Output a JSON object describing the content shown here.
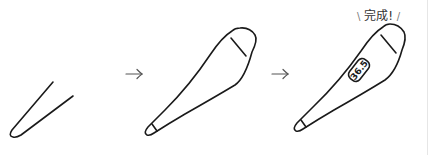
{
  "steps": [
    {
      "id": 1,
      "description": "V-shaped outline (start of drawing)"
    },
    {
      "id": 2,
      "description": "Thermometer outline with cap line"
    },
    {
      "id": 3,
      "description": "Finished thermometer with display"
    }
  ],
  "arrows": [
    "→",
    "→"
  ],
  "completion_label": {
    "left_deco": "\\",
    "text": "完成!",
    "right_deco": "/"
  },
  "display_reading": "36.5",
  "colors": {
    "stroke": "#1a1a1a",
    "arrow": "#555555",
    "background": "#ffffff"
  }
}
